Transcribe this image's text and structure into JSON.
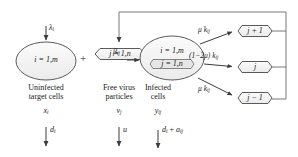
{
  "diagram": {
    "type": "compartmental-flow-diagram",
    "background_color": "#ffffff",
    "stroke_color": "#555555",
    "node_fill": "#f2f2f2",
    "text_color": "#1a1a1a"
  },
  "nodes": {
    "target_cells": {
      "shape": "ellipse",
      "index_label": "i = 1,m",
      "caption_line1": "Uninfected",
      "caption_line2": "target cells",
      "state_variable": "x",
      "state_subscript": "i",
      "death_rate": "d",
      "death_subscript": "i"
    },
    "virus_particles": {
      "shape": "rounded-hexagon",
      "index_label": "j = 1,n",
      "caption_line1": "Free virus",
      "caption_line2": "particles",
      "state_variable": "v",
      "state_subscript": "j",
      "clearance_rate": "u",
      "clearance_subscript": ""
    },
    "infected_cells": {
      "shape": "ellipse",
      "index_label_top": "i = 1,m",
      "index_label_bottom": "j = 1,n",
      "caption_line1": "Infected",
      "caption_line2": "cells",
      "state_variable": "y",
      "state_subscript": "ij",
      "death_rate": "d",
      "death_subscript": "i",
      "death_rate2": "a",
      "death_subscript2": "ij",
      "death_plus": "+"
    },
    "mutant_up": {
      "shape": "rounded-hexagon",
      "label": "j + 1"
    },
    "mutant_same": {
      "shape": "rounded-hexagon",
      "label": "j"
    },
    "mutant_down": {
      "shape": "rounded-hexagon",
      "label": "j − 1"
    }
  },
  "edges": {
    "production_rate": "λ",
    "production_subscript": "i",
    "infection_rate": "β",
    "infection_subscript": "ij",
    "mutation_up": "μ k",
    "mutation_up_subscript": "ij",
    "mutation_same": "(1−2μ) k",
    "mutation_same_subscript": "ij",
    "mutation_down": "μ k",
    "mutation_down_subscript": "ij",
    "plus_operator": "+"
  }
}
